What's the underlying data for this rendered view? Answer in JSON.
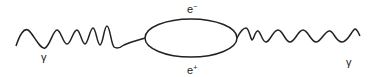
{
  "diagram": {
    "type": "feynman-diagram",
    "labels": {
      "photon_in": "γ",
      "photon_out": "γ",
      "electron_symbol": "e",
      "electron_charge": "−",
      "positron_symbol": "e",
      "positron_charge": "+"
    },
    "colors": {
      "line": "#222222",
      "background": "#ffffff"
    }
  }
}
